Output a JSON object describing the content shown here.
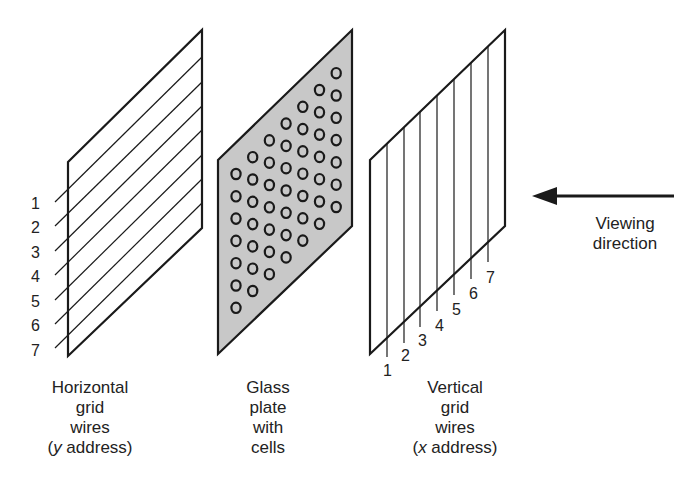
{
  "diagram": {
    "left_panel": {
      "name": "Horizontal grid wires",
      "wire_labels": [
        "1",
        "2",
        "3",
        "4",
        "5",
        "6",
        "7"
      ],
      "caption_lines": [
        "Horizontal",
        "grid",
        "wires"
      ],
      "caption_address_prefix": "(",
      "caption_address_var": "y",
      "caption_address_suffix": " address)"
    },
    "middle_panel": {
      "name": "Glass plate with cells",
      "caption_lines": [
        "Glass",
        "plate",
        "with",
        "cells"
      ],
      "fill_color": "#c8c8c8",
      "cell_columns": 7,
      "cell_rows": 7
    },
    "right_panel": {
      "name": "Vertical grid wires",
      "wire_labels": [
        "1",
        "2",
        "3",
        "4",
        "5",
        "6",
        "7"
      ],
      "caption_lines": [
        "Vertical",
        "grid",
        "wires"
      ],
      "caption_address_prefix": "(",
      "caption_address_var": "x",
      "caption_address_suffix": " address)"
    },
    "arrow": {
      "label_lines": [
        "Viewing",
        "direction"
      ],
      "direction": "left"
    },
    "stroke_color": "#1a1a1a"
  }
}
